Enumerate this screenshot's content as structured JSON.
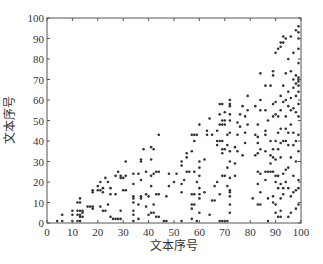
{
  "chart_data": {
    "type": "scatter",
    "title": "",
    "xlabel": "文本序号",
    "ylabel": "文本序号",
    "xlim": [
      0,
      100
    ],
    "ylim": [
      0,
      100
    ],
    "xticks": [
      0,
      10,
      20,
      30,
      40,
      50,
      60,
      70,
      80,
      90,
      100
    ],
    "yticks": [
      0,
      10,
      20,
      30,
      40,
      50,
      60,
      70,
      80,
      90,
      100
    ],
    "grid": false,
    "legend": null,
    "marker_color": "#333333",
    "series": [
      {
        "name": "pairs",
        "points": [
          [
            4,
            1
          ],
          [
            6,
            1
          ],
          [
            6,
            4
          ],
          [
            10,
            1
          ],
          [
            10,
            4
          ],
          [
            10,
            6
          ],
          [
            12,
            1
          ],
          [
            12,
            4
          ],
          [
            12,
            6
          ],
          [
            12,
            10
          ],
          [
            13,
            1
          ],
          [
            13,
            3
          ],
          [
            13,
            4
          ],
          [
            13,
            6
          ],
          [
            13,
            10
          ],
          [
            13,
            12
          ],
          [
            14,
            3
          ],
          [
            14,
            5
          ],
          [
            14,
            6
          ],
          [
            16,
            8
          ],
          [
            17,
            8
          ],
          [
            18,
            7
          ],
          [
            18,
            8
          ],
          [
            18,
            15
          ],
          [
            18,
            16
          ],
          [
            20,
            16
          ],
          [
            20,
            18
          ],
          [
            21,
            8
          ],
          [
            21,
            16
          ],
          [
            21,
            20
          ],
          [
            22,
            6
          ],
          [
            22,
            15
          ],
          [
            22,
            17
          ],
          [
            23,
            6
          ],
          [
            23,
            22
          ],
          [
            24,
            9
          ],
          [
            24,
            20
          ],
          [
            25,
            3
          ],
          [
            25,
            14
          ],
          [
            25,
            17
          ],
          [
            26,
            2
          ],
          [
            27,
            2
          ],
          [
            27,
            14
          ],
          [
            27,
            23
          ],
          [
            28,
            2
          ],
          [
            28,
            25
          ],
          [
            29,
            2
          ],
          [
            29,
            6
          ],
          [
            29,
            22
          ],
          [
            29,
            23
          ],
          [
            30,
            22
          ],
          [
            30,
            16
          ],
          [
            31,
            16
          ],
          [
            31,
            23
          ],
          [
            31,
            30
          ],
          [
            34,
            1
          ],
          [
            34,
            4
          ],
          [
            34,
            6
          ],
          [
            34,
            10
          ],
          [
            34,
            12
          ],
          [
            34,
            13
          ],
          [
            34,
            19
          ],
          [
            34,
            24
          ],
          [
            36,
            2
          ],
          [
            36,
            9
          ],
          [
            36,
            24
          ],
          [
            37,
            12
          ],
          [
            37,
            13
          ],
          [
            37,
            21
          ],
          [
            37,
            30
          ],
          [
            37,
            31
          ],
          [
            38,
            36
          ],
          [
            39,
            8
          ],
          [
            39,
            14
          ],
          [
            39,
            25
          ],
          [
            40,
            4
          ],
          [
            40,
            13
          ],
          [
            41,
            5
          ],
          [
            41,
            18
          ],
          [
            41,
            23
          ],
          [
            41,
            31
          ],
          [
            41,
            37
          ],
          [
            42,
            5
          ],
          [
            42,
            9
          ],
          [
            42,
            24
          ],
          [
            42,
            36
          ],
          [
            43,
            3
          ],
          [
            43,
            14
          ],
          [
            43,
            25
          ],
          [
            44,
            3
          ],
          [
            44,
            14
          ],
          [
            44,
            25
          ],
          [
            44,
            43
          ],
          [
            46,
            1
          ],
          [
            47,
            1
          ],
          [
            47,
            13
          ],
          [
            48,
            18
          ],
          [
            48,
            24
          ],
          [
            50,
            20
          ],
          [
            51,
            24
          ],
          [
            53,
            1
          ],
          [
            53,
            15
          ],
          [
            53,
            19
          ],
          [
            53,
            28
          ],
          [
            53,
            30
          ],
          [
            54,
            21
          ],
          [
            55,
            25
          ],
          [
            55,
            32
          ],
          [
            55,
            34
          ],
          [
            56,
            25
          ],
          [
            57,
            2
          ],
          [
            57,
            7
          ],
          [
            57,
            9
          ],
          [
            57,
            14
          ],
          [
            57,
            35
          ],
          [
            57,
            43
          ],
          [
            58,
            9
          ],
          [
            58,
            14
          ],
          [
            58,
            25
          ],
          [
            58,
            40
          ],
          [
            58,
            43
          ],
          [
            59,
            1
          ],
          [
            59,
            20
          ],
          [
            59,
            43
          ],
          [
            60,
            5
          ],
          [
            60,
            12
          ],
          [
            60,
            14
          ],
          [
            60,
            17
          ],
          [
            60,
            23
          ],
          [
            60,
            27
          ],
          [
            60,
            30
          ],
          [
            60,
            48
          ],
          [
            62,
            15
          ],
          [
            62,
            31
          ],
          [
            63,
            43
          ],
          [
            63,
            45
          ],
          [
            64,
            4
          ],
          [
            64,
            51
          ],
          [
            65,
            11
          ],
          [
            65,
            43
          ],
          [
            66,
            11
          ],
          [
            66,
            18
          ],
          [
            67,
            20
          ],
          [
            67,
            38
          ],
          [
            67,
            40
          ],
          [
            67,
            45
          ],
          [
            68,
            1
          ],
          [
            68,
            14
          ],
          [
            68,
            40
          ],
          [
            68,
            48
          ],
          [
            68,
            53
          ],
          [
            68,
            58
          ],
          [
            69,
            1
          ],
          [
            69,
            23
          ],
          [
            69,
            34
          ],
          [
            69,
            36
          ],
          [
            69,
            40
          ],
          [
            69,
            48
          ],
          [
            69,
            50
          ],
          [
            69,
            58
          ],
          [
            70,
            1
          ],
          [
            70,
            23
          ],
          [
            70,
            36
          ],
          [
            70,
            48
          ],
          [
            70,
            50
          ],
          [
            70,
            54
          ],
          [
            71,
            1
          ],
          [
            71,
            18
          ],
          [
            71,
            27
          ],
          [
            71,
            38
          ],
          [
            71,
            43
          ],
          [
            72,
            5
          ],
          [
            72,
            9
          ],
          [
            72,
            13
          ],
          [
            72,
            15
          ],
          [
            72,
            16
          ],
          [
            72,
            22
          ],
          [
            72,
            30
          ],
          [
            72,
            35
          ],
          [
            72,
            44
          ],
          [
            72,
            50
          ],
          [
            72,
            53
          ],
          [
            72,
            57
          ],
          [
            72,
            58
          ],
          [
            72,
            60
          ],
          [
            74,
            23
          ],
          [
            74,
            29
          ],
          [
            74,
            37
          ],
          [
            75,
            35
          ],
          [
            75,
            43
          ],
          [
            75,
            49
          ],
          [
            76,
            47
          ],
          [
            76,
            53
          ],
          [
            77,
            33
          ],
          [
            77,
            57
          ],
          [
            78,
            39
          ],
          [
            78,
            44
          ],
          [
            78,
            52
          ],
          [
            79,
            48
          ],
          [
            79,
            55
          ],
          [
            79,
            62
          ],
          [
            81,
            12
          ],
          [
            82,
            33
          ],
          [
            82,
            43
          ],
          [
            82,
            57
          ],
          [
            83,
            9
          ],
          [
            83,
            19
          ],
          [
            83,
            25
          ],
          [
            83,
            34
          ],
          [
            83,
            39
          ],
          [
            83,
            42
          ],
          [
            83,
            48
          ],
          [
            84,
            9
          ],
          [
            84,
            15
          ],
          [
            84,
            24
          ],
          [
            84,
            36
          ],
          [
            84,
            55
          ],
          [
            84,
            60
          ],
          [
            84,
            73
          ],
          [
            86,
            21
          ],
          [
            86,
            25
          ],
          [
            86,
            35
          ],
          [
            86,
            43
          ],
          [
            86,
            45
          ],
          [
            86,
            55
          ],
          [
            86,
            67
          ],
          [
            87,
            1
          ],
          [
            87,
            12
          ],
          [
            87,
            25
          ],
          [
            87,
            50
          ],
          [
            88,
            25
          ],
          [
            88,
            29
          ],
          [
            88,
            33
          ],
          [
            88,
            40
          ],
          [
            88,
            67
          ],
          [
            89,
            10
          ],
          [
            89,
            13
          ],
          [
            89,
            25
          ],
          [
            89,
            32
          ],
          [
            89,
            36
          ],
          [
            89,
            52
          ],
          [
            89,
            58
          ],
          [
            89,
            72
          ],
          [
            89,
            74
          ],
          [
            90,
            5
          ],
          [
            90,
            9
          ],
          [
            90,
            20
          ],
          [
            90,
            23
          ],
          [
            90,
            31
          ],
          [
            90,
            40
          ],
          [
            90,
            53
          ],
          [
            90,
            59
          ],
          [
            90,
            83
          ],
          [
            91,
            3
          ],
          [
            91,
            17
          ],
          [
            91,
            23
          ],
          [
            91,
            36
          ],
          [
            91,
            44
          ],
          [
            91,
            52
          ],
          [
            91,
            85
          ],
          [
            92,
            3
          ],
          [
            92,
            6
          ],
          [
            92,
            12
          ],
          [
            92,
            19
          ],
          [
            92,
            32
          ],
          [
            92,
            39
          ],
          [
            92,
            46
          ],
          [
            92,
            55
          ],
          [
            92,
            62
          ],
          [
            92,
            86
          ],
          [
            92,
            88
          ],
          [
            93,
            14
          ],
          [
            93,
            17
          ],
          [
            93,
            24
          ],
          [
            93,
            40
          ],
          [
            93,
            59
          ],
          [
            93,
            67
          ],
          [
            93,
            88
          ],
          [
            93,
            91
          ],
          [
            94,
            20
          ],
          [
            94,
            26
          ],
          [
            94,
            40
          ],
          [
            94,
            46
          ],
          [
            94,
            52
          ],
          [
            94,
            60
          ],
          [
            94,
            73
          ],
          [
            94,
            90
          ],
          [
            95,
            3
          ],
          [
            95,
            17
          ],
          [
            95,
            27
          ],
          [
            95,
            38
          ],
          [
            95,
            44
          ],
          [
            95,
            57
          ],
          [
            95,
            64
          ],
          [
            95,
            80
          ],
          [
            96,
            5
          ],
          [
            96,
            13
          ],
          [
            96,
            32
          ],
          [
            96,
            48
          ],
          [
            96,
            55
          ],
          [
            96,
            61
          ],
          [
            96,
            74
          ],
          [
            96,
            91
          ],
          [
            97,
            15
          ],
          [
            97,
            23
          ],
          [
            97,
            38
          ],
          [
            97,
            44
          ],
          [
            97,
            56
          ],
          [
            97,
            66
          ],
          [
            97,
            70
          ],
          [
            97,
            83
          ],
          [
            98,
            7
          ],
          [
            98,
            16
          ],
          [
            98,
            30
          ],
          [
            98,
            40
          ],
          [
            98,
            54
          ],
          [
            98,
            62
          ],
          [
            98,
            68
          ],
          [
            98,
            72
          ],
          [
            98,
            94
          ],
          [
            99,
            9
          ],
          [
            99,
            17
          ],
          [
            99,
            21
          ],
          [
            99,
            35
          ],
          [
            99,
            43
          ],
          [
            99,
            52
          ],
          [
            99,
            58
          ],
          [
            99,
            64
          ],
          [
            99,
            67
          ],
          [
            99,
            69
          ],
          [
            99,
            70
          ],
          [
            99,
            71
          ],
          [
            99,
            78
          ],
          [
            99,
            85
          ],
          [
            99,
            90
          ],
          [
            99,
            93
          ],
          [
            99,
            96
          ]
        ]
      }
    ]
  }
}
